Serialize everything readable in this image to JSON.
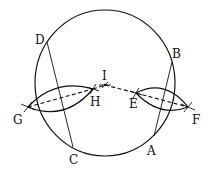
{
  "diagram": {
    "type": "geometric-construction",
    "circle": {
      "cx": 105,
      "cy": 83,
      "rx": 70,
      "ry": 73
    },
    "points": {
      "A": {
        "label": "A",
        "x": 154,
        "y": 136,
        "lx": 147,
        "ly": 155
      },
      "B": {
        "label": "B",
        "x": 172,
        "y": 62,
        "lx": 172,
        "ly": 58
      },
      "C": {
        "label": "C",
        "x": 73,
        "y": 147,
        "lx": 69,
        "ly": 164
      },
      "D": {
        "label": "D",
        "x": 47,
        "y": 42,
        "lx": 35,
        "ly": 44
      },
      "E": {
        "label": "E",
        "x": 136,
        "y": 93,
        "lx": 129,
        "ly": 108
      },
      "F": {
        "label": "F",
        "x": 188,
        "y": 107,
        "lx": 192,
        "ly": 124
      },
      "G": {
        "label": "G",
        "x": 28,
        "y": 107,
        "lx": 13,
        "ly": 124
      },
      "H": {
        "label": "H",
        "x": 93,
        "y": 89,
        "lx": 90,
        "ly": 106
      },
      "I": {
        "label": "I",
        "x": 105,
        "y": 85,
        "lx": 102,
        "ly": 80
      }
    },
    "chords": [
      {
        "from": "D",
        "to": "C"
      },
      {
        "from": "B",
        "to": "A"
      }
    ],
    "dashed_lines": [
      {
        "from": "G",
        "to": "H"
      },
      {
        "from": "H",
        "to": "I"
      },
      {
        "from": "I",
        "to": "E"
      },
      {
        "from": "E",
        "to": "F"
      }
    ],
    "lenses": [
      {
        "name": "left-bisector-arcs",
        "between": [
          "G",
          "H"
        ]
      },
      {
        "name": "right-bisector-arcs",
        "between": [
          "E",
          "F"
        ]
      }
    ]
  }
}
